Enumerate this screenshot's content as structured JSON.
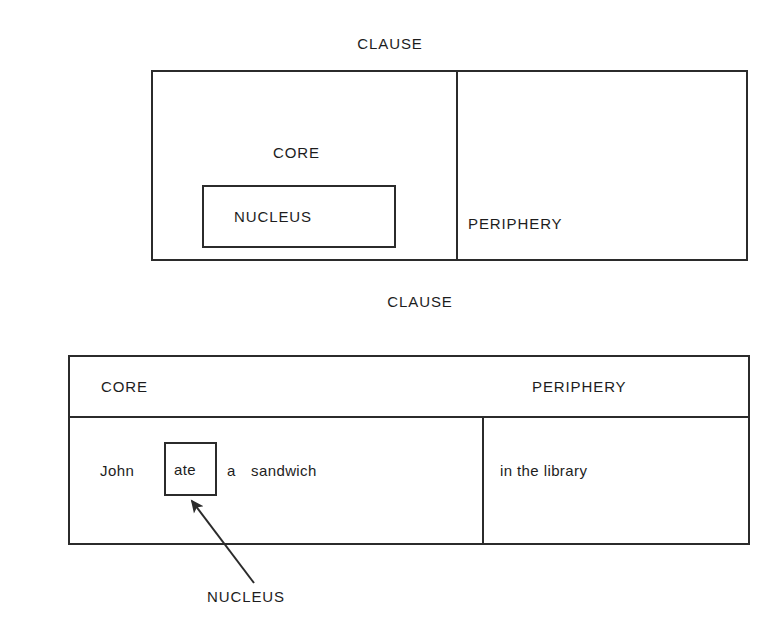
{
  "figure": {
    "type": "linguistic-layered-structure-diagram",
    "ink_color": "#2b2b2b",
    "background_color": "#ffffff"
  },
  "diagram_one": {
    "title": "CLAUSE",
    "core_label": "CORE",
    "nucleus_label": "NUCLEUS",
    "periphery_label": "PERIPHERY"
  },
  "diagram_two": {
    "title": "CLAUSE",
    "headers": {
      "core": "CORE",
      "periphery": "PERIPHERY"
    },
    "core_words": {
      "subject": "John",
      "nucleus": "ate",
      "determiner": "a",
      "object": "sandwich"
    },
    "periphery_phrase": "in the library",
    "callout_label": "NUCLEUS"
  }
}
